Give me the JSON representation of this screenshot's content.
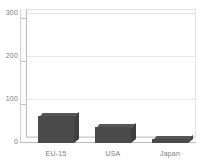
{
  "chart_data": {
    "type": "bar",
    "title": "",
    "subtitle": "",
    "xlabel": "",
    "ylabel": "",
    "categories": [
      "EU-15",
      "USA",
      "Japan"
    ],
    "values": [
      63,
      37,
      9
    ],
    "series": [
      {
        "name": "",
        "values": [
          63,
          37,
          9
        ]
      }
    ],
    "ylim": [
      0,
      300
    ],
    "yticks": [
      0,
      100,
      200,
      300
    ],
    "ytick_labels": [
      "0",
      "100",
      "200",
      "300"
    ],
    "gridlines": true,
    "grid_axis": "y",
    "legend": false,
    "legend_position": "none",
    "style_3d": true,
    "annotations": []
  },
  "style": {
    "bar_color": "#4a4a4a",
    "bar_top_color": "#565656",
    "bar_side_color": "#3f3f3f",
    "grid_color": "#e6e6e6",
    "axis_color": "#bdbdbd",
    "tick_text_color": "#7a7a7a",
    "background": "#ffffff",
    "wall_color": "#fefefe"
  }
}
